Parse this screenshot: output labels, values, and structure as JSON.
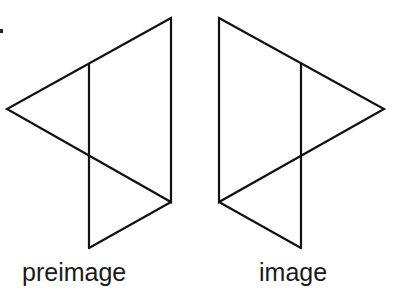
{
  "diagram": {
    "stroke_color": "#111111",
    "figures": [
      {
        "id": "preimage",
        "label": "preimage",
        "triangle_large": [
          [
            171,
            18
          ],
          [
            7,
            109
          ],
          [
            171,
            202
          ]
        ],
        "triangle_small": [
          [
            89,
            156
          ],
          [
            171,
            202
          ],
          [
            89,
            248
          ]
        ],
        "vertical_segment": [
          [
            89,
            64
          ],
          [
            89,
            248
          ]
        ]
      },
      {
        "id": "image",
        "label": "image",
        "triangle_large": [
          [
            219,
            18
          ],
          [
            384,
            109
          ],
          [
            219,
            202
          ]
        ],
        "triangle_small": [
          [
            301,
            156
          ],
          [
            219,
            202
          ],
          [
            301,
            248
          ]
        ],
        "vertical_segment": [
          [
            301,
            64
          ],
          [
            301,
            248
          ]
        ]
      }
    ]
  },
  "labels": {
    "preimage": "preimage",
    "image": "image"
  }
}
